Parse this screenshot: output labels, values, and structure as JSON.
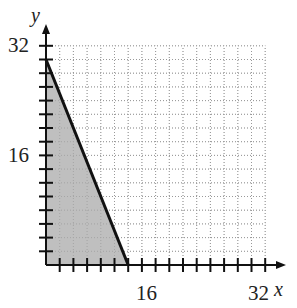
{
  "chart_data": {
    "type": "area",
    "title": "",
    "xlabel": "x",
    "ylabel": "y",
    "xlim": [
      0,
      32
    ],
    "ylim": [
      0,
      32
    ],
    "x_tick_labels": [
      "16",
      "32"
    ],
    "y_tick_labels": [
      "16",
      "32"
    ],
    "tick_step": 2,
    "grid": true,
    "grid_style": "dotted",
    "line": {
      "x": [
        0,
        12
      ],
      "y": [
        30,
        0
      ],
      "style": "solid"
    },
    "shaded_region": {
      "polygon": [
        [
          0,
          0
        ],
        [
          0,
          30
        ],
        [
          12,
          0
        ]
      ],
      "color": "#b8b8b8"
    },
    "inequality_hint": "5x + 2y <= 60, x >= 0, y >= 0"
  },
  "labels": {
    "x_axis": "x",
    "y_axis": "y",
    "x16": "16",
    "x32": "32",
    "y16": "16",
    "y32": "32"
  }
}
